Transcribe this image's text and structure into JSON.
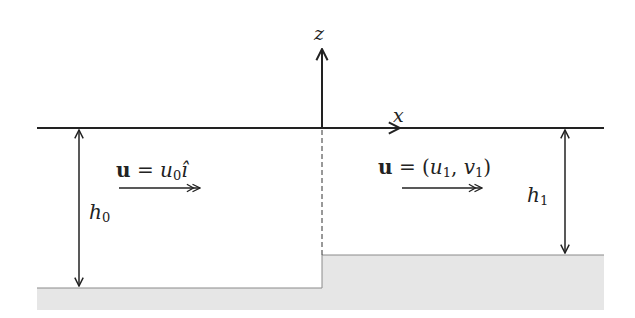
{
  "diagram": {
    "type": "shallow-water step flow schematic",
    "axes": {
      "vertical_label": "z",
      "horizontal_label": "x"
    },
    "left_region": {
      "velocity_label": "u = u0 î",
      "velocity_parts": {
        "vec": "u",
        "eq": " = ",
        "sym": "u",
        "sub": "0",
        "unit": "î"
      },
      "depth_label": {
        "sym": "h",
        "sub": "0"
      }
    },
    "right_region": {
      "velocity_label": "u = (u1, v1)",
      "velocity_parts": {
        "vec": "u",
        "eq": " = (",
        "sym1": "u",
        "sub1": "1",
        "comma": ", ",
        "sym2": "v",
        "sub2": "1",
        "close": ")"
      },
      "depth_label": {
        "sym": "h",
        "sub": "1"
      }
    },
    "colors": {
      "line": "#222222",
      "bed": "#e6e6e6",
      "bed_edge": "#8a8a8a",
      "text": "#222222"
    }
  }
}
